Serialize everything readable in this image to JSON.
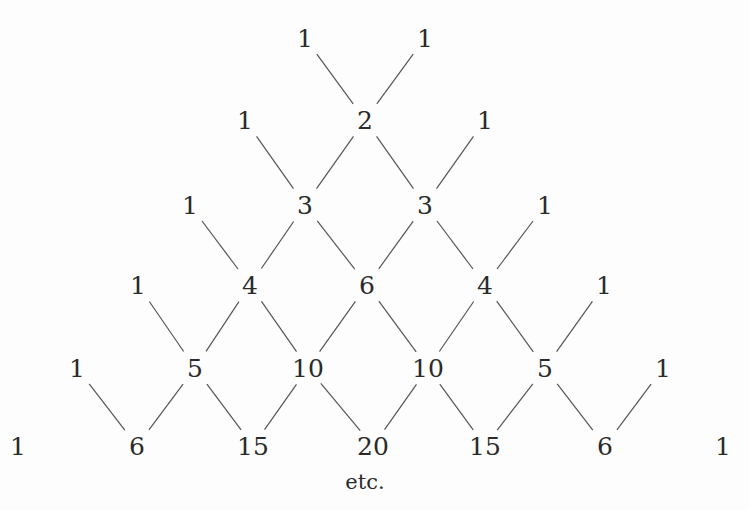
{
  "diagram": {
    "title": "",
    "line_color": "#555555",
    "rows": [
      {
        "y": 38,
        "cells": [
          {
            "x": 305,
            "v": "1"
          },
          {
            "x": 425,
            "v": "1"
          }
        ]
      },
      {
        "y": 120,
        "cells": [
          {
            "x": 245,
            "v": "1"
          },
          {
            "x": 365,
            "v": "2"
          },
          {
            "x": 485,
            "v": "1"
          }
        ]
      },
      {
        "y": 205,
        "cells": [
          {
            "x": 190,
            "v": "1"
          },
          {
            "x": 305,
            "v": "3"
          },
          {
            "x": 425,
            "v": "3"
          },
          {
            "x": 545,
            "v": "1"
          }
        ]
      },
      {
        "y": 285,
        "cells": [
          {
            "x": 138,
            "v": "1"
          },
          {
            "x": 250,
            "v": "4"
          },
          {
            "x": 367,
            "v": "6"
          },
          {
            "x": 485,
            "v": "4"
          },
          {
            "x": 604,
            "v": "1"
          }
        ]
      },
      {
        "y": 368,
        "cells": [
          {
            "x": 77,
            "v": "1"
          },
          {
            "x": 195,
            "v": "5"
          },
          {
            "x": 308,
            "v": "10"
          },
          {
            "x": 428,
            "v": "10"
          },
          {
            "x": 545,
            "v": "5"
          },
          {
            "x": 663,
            "v": "1"
          }
        ]
      },
      {
        "y": 446,
        "cells": [
          {
            "x": 18,
            "v": "1"
          },
          {
            "x": 137,
            "v": "6"
          },
          {
            "x": 253,
            "v": "15"
          },
          {
            "x": 373,
            "v": "20"
          },
          {
            "x": 485,
            "v": "15"
          },
          {
            "x": 605,
            "v": "6"
          },
          {
            "x": 723,
            "v": "1"
          }
        ]
      }
    ],
    "footer": {
      "x": 365,
      "y": 482,
      "text": "etc."
    }
  }
}
